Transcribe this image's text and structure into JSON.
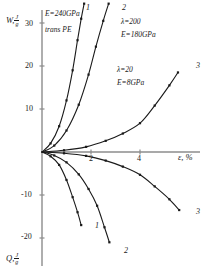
{
  "figure": {
    "axes": {
      "y_label_top": "W,",
      "y_label_top_num": "J",
      "y_label_top_den": "g",
      "y_label_bottom": "Q,",
      "y_label_bottom_num": "J",
      "y_label_bottom_den": "g",
      "x_label": "ε, %",
      "y_ticks": [
        "30",
        "20",
        "10",
        "-10",
        "-20"
      ],
      "x_ticks": [
        "2",
        "4"
      ],
      "xlim": [
        0,
        6
      ],
      "ylim": [
        -25,
        33
      ]
    },
    "annotations": [
      {
        "name": "annotation-curve1",
        "lines": [
          "E=240GPa",
          "trans PE"
        ]
      },
      {
        "name": "annotation-curve2",
        "lines": [
          "λ=200",
          "E=180GPa"
        ]
      },
      {
        "name": "annotation-curve3",
        "lines": [
          "λ=20",
          "E=8GPa"
        ]
      }
    ],
    "curve_numbers": [
      "1",
      "2",
      "3",
      "1",
      "2",
      "3"
    ],
    "colors": {
      "axis": "#8c8c8c",
      "curve": "#1a1a1a",
      "marker": "#1a1a1a"
    }
  },
  "chart_data": {
    "type": "line",
    "title": "",
    "xlabel": "ε, %",
    "ylabel": "W, J/g  /  Q, J/g",
    "xlim": [
      0,
      6
    ],
    "ylim": [
      -25,
      33
    ],
    "grid": false,
    "legend": "none",
    "series": [
      {
        "name": "1 (W) E=240GPa trans PE",
        "label": "1",
        "branch": "work",
        "x": [
          0.0,
          0.35,
          0.7,
          1.0,
          1.25,
          1.45,
          1.6,
          1.72
        ],
        "y": [
          0.0,
          2.0,
          6.0,
          12.0,
          19.0,
          26.0,
          31.0,
          34.5
        ]
      },
      {
        "name": "2 (W) lambda=200 E=180GPa",
        "label": "2",
        "branch": "work",
        "x": [
          0.0,
          0.5,
          1.0,
          1.5,
          1.9,
          2.2,
          2.5,
          2.72
        ],
        "y": [
          0.0,
          1.5,
          5.0,
          11.0,
          18.0,
          24.5,
          30.5,
          34.5
        ]
      },
      {
        "name": "3 (W) lambda=20 E=8GPa",
        "label": "3",
        "branch": "work",
        "x": [
          0.0,
          0.9,
          1.8,
          2.6,
          3.3,
          4.0,
          4.6,
          5.2,
          5.55
        ],
        "y": [
          0.0,
          0.4,
          1.2,
          2.6,
          4.3,
          6.7,
          10.8,
          15.5,
          18.5
        ]
      },
      {
        "name": "1 (Q) E=240GPa trans PE",
        "label": "1",
        "branch": "heat",
        "x": [
          0.0,
          0.35,
          0.7,
          1.0,
          1.25,
          1.45,
          1.6
        ],
        "y": [
          0.0,
          -1.0,
          -3.0,
          -6.5,
          -10.5,
          -14.0,
          -17.0
        ]
      },
      {
        "name": "2 (Q) lambda=200 E=180GPa",
        "label": "2",
        "branch": "heat",
        "x": [
          0.0,
          0.5,
          1.0,
          1.5,
          1.9,
          2.25,
          2.55,
          2.75
        ],
        "y": [
          0.0,
          -0.8,
          -2.4,
          -5.2,
          -8.6,
          -12.5,
          -17.5,
          -21.0
        ]
      },
      {
        "name": "3 (Q) lambda=20 E=8GPa",
        "label": "3",
        "branch": "heat",
        "x": [
          0.0,
          0.9,
          1.8,
          2.6,
          3.3,
          4.0,
          4.6,
          5.2,
          5.6
        ],
        "y": [
          0.0,
          -0.3,
          -0.9,
          -2.0,
          -3.4,
          -5.3,
          -8.0,
          -11.0,
          -13.5
        ]
      }
    ]
  }
}
